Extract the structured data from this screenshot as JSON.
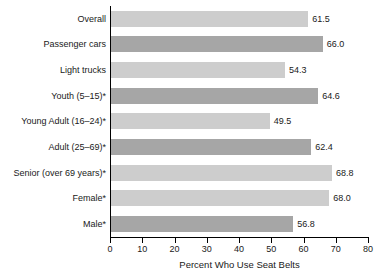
{
  "chart_data": {
    "type": "bar",
    "orientation": "horizontal",
    "title": "",
    "xlabel": "Percent Who Use Seat Belts",
    "ylabel": "",
    "xlim": [
      0,
      80
    ],
    "ylim": null,
    "grid": false,
    "legend": null,
    "xticks": [
      0,
      10,
      20,
      30,
      40,
      50,
      60,
      70,
      80
    ],
    "xtick_labels": [
      "0",
      "10",
      "20",
      "30",
      "40",
      "50",
      "60",
      "70",
      "80"
    ],
    "categories": [
      "Overall",
      "Passenger cars",
      "Light trucks",
      "Youth (5–15)*",
      "Young Adult (16–24)*",
      "Adult (25–69)*",
      "Senior (over 69 years)*",
      "Female*",
      "Male*"
    ],
    "values": [
      61.5,
      66.0,
      54.3,
      64.6,
      49.5,
      62.4,
      68.8,
      68.0,
      56.8
    ],
    "value_labels": [
      "61.5",
      "66.0",
      "54.3",
      "64.6",
      "49.5",
      "62.4",
      "68.8",
      "68.0",
      "56.8"
    ],
    "bar_colors": [
      "#cdcdcd",
      "#a6a6a6",
      "#cdcdcd",
      "#a6a6a6",
      "#cdcdcd",
      "#a6a6a6",
      "#cdcdcd",
      "#cdcdcd",
      "#a6a6a6"
    ],
    "bars": [
      {
        "label": "Overall",
        "value": 61.5,
        "value_label": "61.5",
        "shade": "light"
      },
      {
        "label": "Passenger cars",
        "value": 66.0,
        "value_label": "66.0",
        "shade": "dark"
      },
      {
        "label": "Light trucks",
        "value": 54.3,
        "value_label": "54.3",
        "shade": "light"
      },
      {
        "label": "Youth (5–15)*",
        "value": 64.6,
        "value_label": "64.6",
        "shade": "dark"
      },
      {
        "label": "Young Adult (16–24)*",
        "value": 49.5,
        "value_label": "49.5",
        "shade": "light"
      },
      {
        "label": "Adult (25–69)*",
        "value": 62.4,
        "value_label": "62.4",
        "shade": "dark"
      },
      {
        "label": "Senior (over 69 years)*",
        "value": 68.8,
        "value_label": "68.8",
        "shade": "dark"
      },
      {
        "label": "Female*",
        "value": 68.0,
        "value_label": "68.0",
        "shade": "light"
      },
      {
        "label": "Male*",
        "value": 56.8,
        "value_label": "56.8",
        "shade": "dark"
      }
    ],
    "axis_color": "#000000",
    "text_color": "#1a1a1a",
    "background": "#ffffff"
  }
}
